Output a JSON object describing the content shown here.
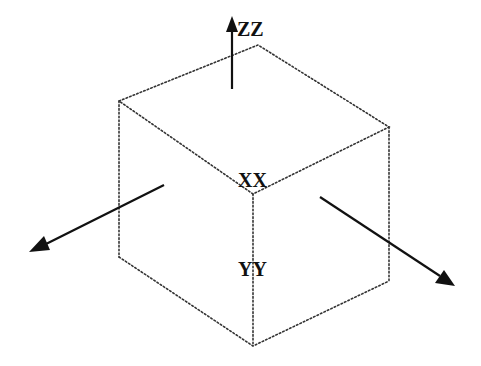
{
  "diagram": {
    "type": "isometric-cube-coordinate-axes",
    "labels": {
      "x": "XX",
      "y": "YY",
      "z": "ZZ"
    },
    "colors": {
      "background": "#ffffff",
      "edges": "#333333",
      "axes": "#111111",
      "text": "#111111"
    }
  }
}
